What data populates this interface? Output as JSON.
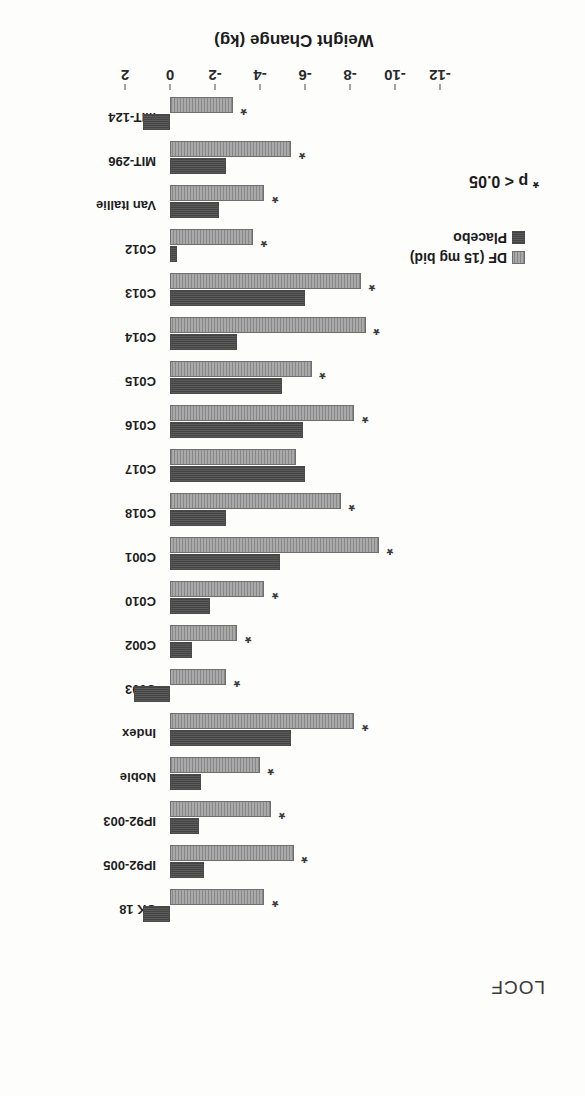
{
  "figure": {
    "title": "LOCF",
    "significance_note": "* p < 0.05",
    "rotation_degrees": 180
  },
  "legend": {
    "position": "bottom-right-of-plot",
    "entries": [
      {
        "label": "DF (15 mg bid)",
        "swatch": "light-hatched",
        "color": "#a9a9a9"
      },
      {
        "label": "Placebo",
        "swatch": "dark-solid",
        "color": "#5b5b5b"
      }
    ]
  },
  "chart_data": {
    "type": "bar",
    "orientation": "horizontal",
    "title": "LOCF",
    "xlabel": "",
    "ylabel": "Weight Change (kg)",
    "value_axis_label": "Weight Change (kg)",
    "value_axis_ticks": [
      2,
      0,
      -2,
      -4,
      -6,
      -8,
      -10,
      -12
    ],
    "value_axis_tick_labels": [
      "2",
      "0",
      "-2",
      "-4",
      "-6",
      "-8",
      "-10",
      "-12"
    ],
    "ylim": [
      2,
      -13
    ],
    "grid": false,
    "legend_position": "inside-bottom-right",
    "annotation": "* p < 0.05",
    "categories": [
      "UK 18",
      "IP92-005",
      "IP92-003",
      "Noble",
      "Index",
      "C003",
      "C002",
      "C010",
      "C001",
      "C018",
      "C017",
      "C016",
      "C015",
      "C014",
      "C013",
      "C012",
      "Van Itallie",
      "MIT-296",
      "MIT-124"
    ],
    "series": [
      {
        "name": "Placebo",
        "color": "#5b5b5b",
        "values": [
          1.2,
          -1.5,
          -1.3,
          -1.4,
          -5.4,
          1.6,
          -1.0,
          -1.8,
          -4.9,
          -2.5,
          -6.0,
          -5.9,
          -5.0,
          -3.0,
          -6.0,
          -0.3,
          -2.2,
          -2.5,
          1.2
        ]
      },
      {
        "name": "DF (15 mg bid)",
        "color": "#a9a9a9",
        "values": [
          -4.2,
          -5.5,
          -4.5,
          -4.0,
          -8.2,
          -2.5,
          -3.0,
          -4.2,
          -9.3,
          -7.6,
          -5.6,
          -8.2,
          -6.3,
          -8.7,
          -8.5,
          -3.7,
          -4.2,
          -5.4,
          -2.8
        ]
      }
    ],
    "significant": [
      true,
      true,
      true,
      true,
      true,
      true,
      true,
      true,
      true,
      true,
      false,
      true,
      true,
      true,
      true,
      true,
      true,
      true,
      true
    ]
  }
}
